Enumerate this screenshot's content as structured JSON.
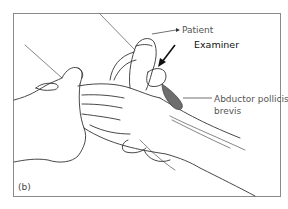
{
  "figure": {
    "panel_label": "(b)",
    "labels": {
      "patient": "Patient",
      "examiner": "Examiner",
      "muscle_line1": "Abductor pollicis",
      "muscle_line2": "brevis"
    },
    "colors": {
      "line": "#333333",
      "muscle_fill": "#6e6e6e",
      "frame": "#8a8a8a",
      "text": "#555555"
    }
  }
}
